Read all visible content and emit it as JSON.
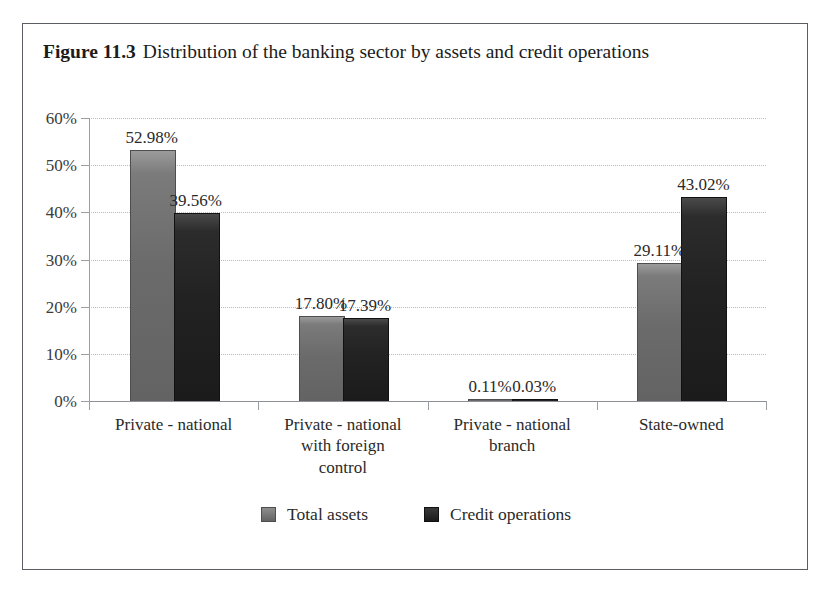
{
  "figure": {
    "label": "Figure 11.3",
    "caption": "Distribution of the banking sector by assets and credit operations"
  },
  "chart_data": {
    "type": "bar",
    "title": "Distribution of the banking sector by assets and credit operations",
    "xlabel": "",
    "ylabel": "",
    "ylim": [
      0,
      60
    ],
    "ytick_labels": [
      "0%",
      "10%",
      "20%",
      "30%",
      "40%",
      "50%",
      "60%"
    ],
    "ytick_values": [
      0,
      10,
      20,
      30,
      40,
      50,
      60
    ],
    "grid": true,
    "legend_position": "bottom",
    "categories": [
      "Private - national",
      "Private - national with foreign control",
      "Private - national branch",
      "State-owned"
    ],
    "category_lines": [
      [
        "Private - national"
      ],
      [
        "Private - national",
        "with foreign",
        "control"
      ],
      [
        "Private - national",
        "branch"
      ],
      [
        "State-owned"
      ]
    ],
    "series": [
      {
        "name": "Total assets",
        "color": "#6b6b6b",
        "values": [
          52.98,
          17.8,
          0.11,
          29.11
        ],
        "labels": [
          "52.98%",
          "17.80%",
          "0.11%",
          "29.11%"
        ]
      },
      {
        "name": "Credit operations",
        "color": "#1f1f1f",
        "values": [
          39.56,
          17.39,
          0.03,
          43.02
        ],
        "labels": [
          "39.56%",
          "17.39%",
          "0.03%",
          "43.02%"
        ]
      }
    ]
  },
  "legend": {
    "items": [
      {
        "label": "Total assets"
      },
      {
        "label": "Credit operations"
      }
    ]
  },
  "colors": {
    "frame": "#5a5d61",
    "axis": "#9a9da2",
    "gridline": "#b9bcc2",
    "assets_bar": "#6b6b6b",
    "credit_bar": "#1f1f1f",
    "text": "#2a2a2a",
    "background": "#ffffff"
  }
}
